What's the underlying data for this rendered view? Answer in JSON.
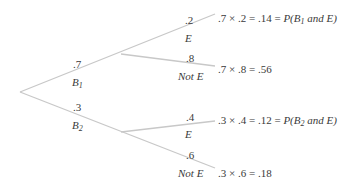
{
  "diagram": {
    "type": "probability-tree",
    "line_color": "#c8c8c8",
    "text_color": "#3a3a3a",
    "first_level": [
      {
        "prob": ".7",
        "event": "B",
        "sub": "1"
      },
      {
        "prob": ".3",
        "event": "B",
        "sub": "2"
      }
    ],
    "second_level": [
      {
        "prob": ".2",
        "event": "E",
        "result": ".7 × .2 = .14 = ",
        "result_tail_pre": "P(B",
        "result_sub": "1",
        "result_tail_post": " and E)"
      },
      {
        "prob": ".8",
        "event": "Not E",
        "result": ".7 × .8 = .56"
      },
      {
        "prob": ".4",
        "event": "E",
        "result": ".3 × .4 = .12 = ",
        "result_tail_pre": "P(B",
        "result_sub": "2",
        "result_tail_post": " and E)"
      },
      {
        "prob": ".6",
        "event": "Not E",
        "result": ".3 × .6 = .18"
      }
    ]
  }
}
